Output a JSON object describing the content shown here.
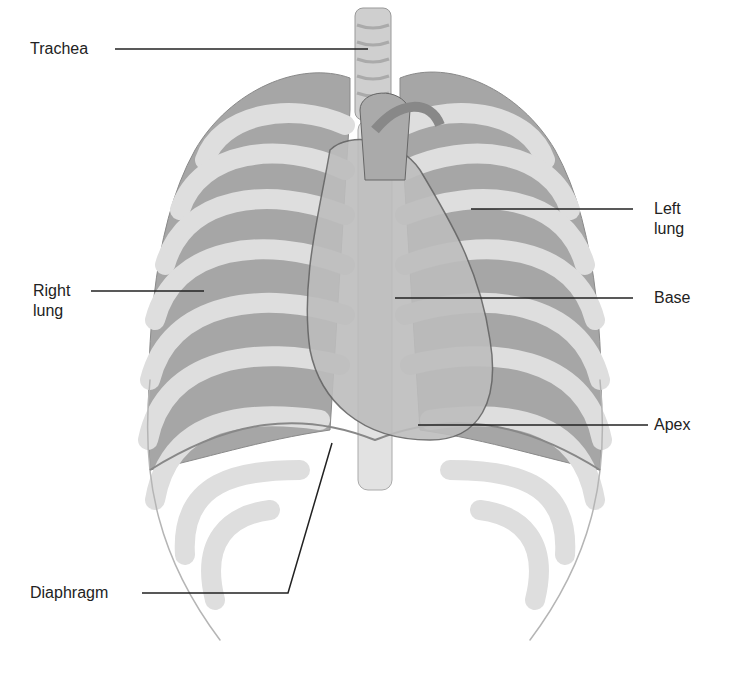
{
  "figure": {
    "labels": {
      "trachea": "Trachea",
      "left_lung_1": "Left",
      "left_lung_2": "lung",
      "right_lung_1": "Right",
      "right_lung_2": "lung",
      "base": "Base",
      "apex": "Apex",
      "diaphragm": "Diaphragm"
    },
    "colors": {
      "bone": "#dcdcdc",
      "lung": "#a8a8a8",
      "heart": "#bdbdbd",
      "outline": "#777777",
      "leader": "#222222"
    }
  }
}
